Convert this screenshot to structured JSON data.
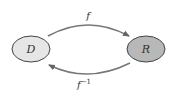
{
  "diagram": {
    "nodes": [
      {
        "id": "D",
        "label": "D",
        "fill": "#e6e6e6"
      },
      {
        "id": "R",
        "label": "R",
        "fill": "#b8b8b8"
      }
    ],
    "edges": [
      {
        "from": "D",
        "to": "R",
        "label": "f",
        "position": "top"
      },
      {
        "from": "R",
        "to": "D",
        "label": "f",
        "superscript": "−1",
        "position": "bottom"
      }
    ],
    "colors": {
      "stroke": "#444444",
      "arrow": "#777777"
    }
  }
}
